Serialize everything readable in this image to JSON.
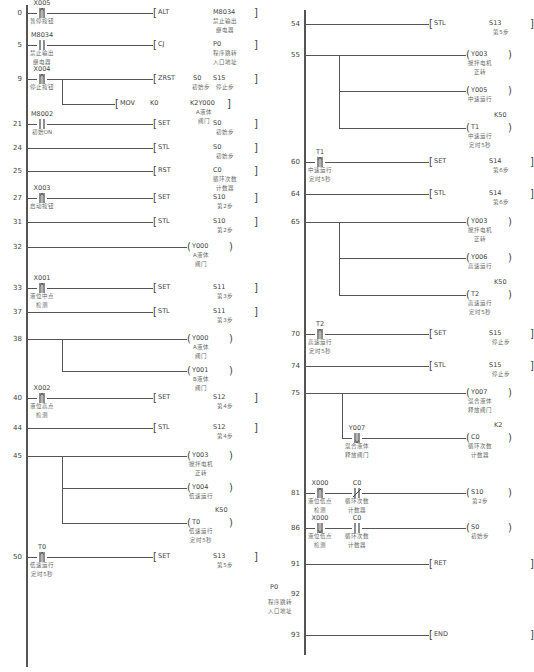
{
  "left_column": {
    "rungs": [
      {
        "step": "0",
        "contact": {
          "addr": "X005",
          "type": "rising",
          "comment": "暂停按钮"
        },
        "instr": "ALT",
        "op1": "",
        "op2": "M8034",
        "op2_comment": "禁止输出\n继电器",
        "bracket": "]"
      },
      {
        "step": "5",
        "contact": {
          "addr": "M8034",
          "type": "no",
          "comment": "禁止输出\n继电器"
        },
        "instr": "CJ",
        "op1": "",
        "op2": "P0",
        "op2_comment": "程序跳转\n入口地址",
        "bracket": "]"
      },
      {
        "step": "9",
        "contact": {
          "addr": "X004",
          "type": "rising",
          "comment": "停止按钮"
        },
        "instr": "ZRST",
        "op1": "S0",
        "op1_comment": "初始步",
        "op2": "S15",
        "op2_comment": "停止步",
        "bracket": "]",
        "branch": {
          "instr": "MOV",
          "op1": "K0",
          "op2": "K2Y000",
          "op2_comment": "A液体\n阀门",
          "bracket": "]"
        }
      },
      {
        "step": "21",
        "contact": {
          "addr": "M8002",
          "type": "no",
          "comment": "初始ON"
        },
        "instr": "SET",
        "op2": "S0",
        "op2_comment": "初始步",
        "bracket": "]"
      },
      {
        "step": "24",
        "instr": "STL",
        "op2": "S0",
        "op2_comment": "初始步",
        "bracket": "]"
      },
      {
        "step": "25",
        "instr": "RST",
        "op2": "C0",
        "op2_comment": "循环次数\n计数器",
        "bracket": "]"
      },
      {
        "step": "27",
        "contact": {
          "addr": "X003",
          "type": "rising",
          "comment": "启动按钮"
        },
        "instr": "SET",
        "op2": "S10",
        "op2_comment": "第2步",
        "bracket": "]"
      },
      {
        "step": "31",
        "instr": "STL",
        "op2": "S10",
        "op2_comment": "第2步",
        "bracket": "]"
      },
      {
        "step": "32",
        "coil": "Y000",
        "coil_comment": "A液体\n阀门"
      },
      {
        "step": "33",
        "contact": {
          "addr": "X001",
          "type": "rising",
          "comment": "液位中点\n检测"
        },
        "instr": "SET",
        "op2": "S11",
        "op2_comment": "第3步",
        "bracket": "]"
      },
      {
        "step": "37",
        "instr": "STL",
        "op2": "S11",
        "op2_comment": "第3步",
        "bracket": "]"
      },
      {
        "step": "38",
        "coils": [
          {
            "coil": "Y000",
            "coil_comment": "A液体\n阀门"
          },
          {
            "coil": "Y001",
            "coil_comment": "B液体\n阀门"
          }
        ]
      },
      {
        "step": "40",
        "contact": {
          "addr": "X002",
          "type": "rising",
          "comment": "液位高点\n检测"
        },
        "instr": "SET",
        "op2": "S12",
        "op2_comment": "第4步",
        "bracket": "]"
      },
      {
        "step": "44",
        "instr": "STL",
        "op2": "S12",
        "op2_comment": "第4步",
        "bracket": "]"
      },
      {
        "step": "45",
        "coils": [
          {
            "coil": "Y003",
            "coil_comment": "搅拌电机\n正转"
          },
          {
            "coil": "Y004",
            "coil_comment": "低速运行"
          },
          {
            "coil": "T0",
            "preset": "K50",
            "coil_comment": "低速运行\n定时5秒"
          }
        ]
      },
      {
        "step": "50",
        "contact": {
          "addr": "T0",
          "type": "rising",
          "comment": "低速运行\n定时5秒"
        },
        "instr": "SET",
        "op2": "S13",
        "op2_comment": "第5步",
        "bracket": "]"
      }
    ]
  },
  "right_column": {
    "rungs": [
      {
        "step": "54",
        "instr": "STL",
        "op2": "S13",
        "op2_comment": "第5步",
        "bracket": "]"
      },
      {
        "step": "55",
        "coils": [
          {
            "coil": "Y003",
            "coil_comment": "搅拌电机\n正转"
          },
          {
            "coil": "Y005",
            "coil_comment": "中速运行"
          },
          {
            "coil": "T1",
            "preset": "K50",
            "coil_comment": "中速运行\n定时5秒"
          }
        ]
      },
      {
        "step": "60",
        "contact": {
          "addr": "T1",
          "type": "rising",
          "comment": "中速运行\n定时5秒"
        },
        "instr": "SET",
        "op2": "S14",
        "op2_comment": "第6步",
        "bracket": "]"
      },
      {
        "step": "64",
        "instr": "STL",
        "op2": "S14",
        "op2_comment": "第6步",
        "bracket": "]"
      },
      {
        "step": "65",
        "coils": [
          {
            "coil": "Y003",
            "coil_comment": "搅拌电机\n正转"
          },
          {
            "coil": "Y006",
            "coil_comment": "高速运行"
          },
          {
            "coil": "T2",
            "preset": "K50",
            "coil_comment": "高速运行\n定时5秒"
          }
        ]
      },
      {
        "step": "70",
        "contact": {
          "addr": "T2",
          "type": "rising",
          "comment": "高速运行\n定时5秒"
        },
        "instr": "SET",
        "op2": "S15",
        "op2_comment": "停止步",
        "bracket": "]"
      },
      {
        "step": "74",
        "instr": "STL",
        "op2": "S15",
        "op2_comment": "停止步",
        "bracket": "]"
      },
      {
        "step": "75",
        "coil": "Y007",
        "coil_comment": "混合液体\n释放阀门",
        "branch": {
          "contact": {
            "addr": "Y007",
            "type": "falling",
            "comment": "混合液体\n释放阀门"
          },
          "coil": "C0",
          "preset": "K2",
          "coil_comment": "循环次数\n计数器"
        }
      },
      {
        "step": "81",
        "contacts": [
          {
            "addr": "X000",
            "type": "rising",
            "comment": "液位低点\n检测"
          },
          {
            "addr": "C0",
            "type": "nc",
            "comment": "循环次数\n计数器"
          }
        ],
        "coil": "S10",
        "coil_comment": "第2步"
      },
      {
        "step": "86",
        "contacts": [
          {
            "addr": "X000",
            "type": "falling",
            "comment": "液位低点\n检测"
          },
          {
            "addr": "C0",
            "type": "no",
            "comment": "循环次数\n计数器"
          }
        ],
        "coil": "S0",
        "coil_comment": "初始步"
      },
      {
        "step": "91",
        "instr": "RET",
        "bracket": "]"
      },
      {
        "step": "92",
        "pointer": "P0",
        "pointer_comment": "程序跳转\n入口地址"
      },
      {
        "step": "93",
        "instr": "END",
        "bracket": "]"
      }
    ]
  },
  "icons": {
    "no": "normally-open-contact",
    "nc": "normally-closed-contact",
    "rising": "rising-edge-contact",
    "falling": "falling-edge-contact",
    "coil": "output-coil",
    "instruction": "instruction-box"
  }
}
